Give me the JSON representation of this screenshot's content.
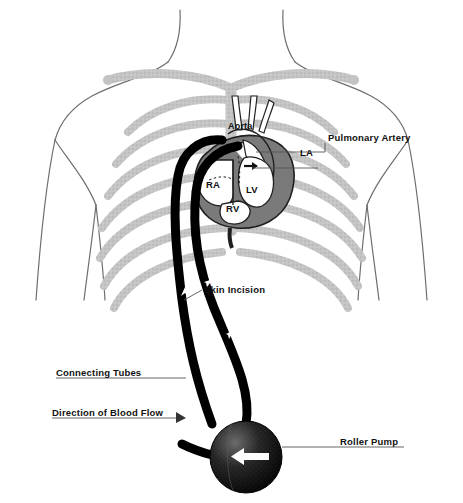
{
  "diagram": {
    "colors": {
      "body_outline": "#6e6e6e",
      "rib_gray": "#bdbdbd",
      "heart_dark": "#7a7a7a",
      "heart_light": "#ffffff",
      "tube_black": "#000000",
      "pump_dark": "#1a1a1a",
      "label_text": "#111111",
      "leader_line": "#555555",
      "background": "#ffffff"
    }
  },
  "anatomy_labels": {
    "aorta": "Aorta",
    "pulmonary_artery": "Pulmonary Artery",
    "left_atrium": "LA",
    "right_atrium": "RA",
    "left_ventricle": "LV",
    "right_ventricle": "RV"
  },
  "callouts": {
    "skin_incision": "Skin Incision",
    "connecting_tubes": "Connecting Tubes",
    "direction_of_blood_flow": "Direction of Blood Flow",
    "roller_pump": "Roller Pump"
  },
  "elements": {
    "torso": "human-torso-outline",
    "ribcage": "rib-cage",
    "heart": "heart-organ",
    "tubes": "bypass-tubing",
    "pump": "roller-pump-sphere",
    "flow_arrows": "blood-flow-direction-arrows"
  }
}
